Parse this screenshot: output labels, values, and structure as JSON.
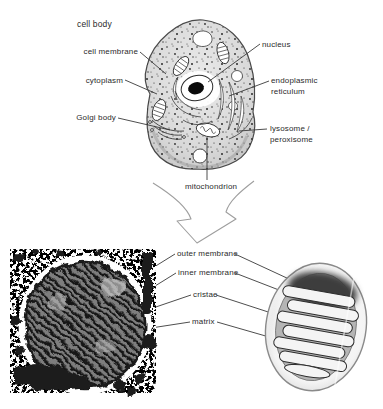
{
  "top_diagram": {
    "title": "cell body",
    "labels": {
      "cell_membrane": "cell membrane",
      "cytoplasm": "cytoplasm",
      "golgi_body": "Golgi body",
      "nucleus": "nucleus",
      "endoplasmic_reticulum_line1": "endoplasmic",
      "endoplasmic_reticulum_line2": "reticulum",
      "lysosome_line1": "lysosome /",
      "lysosome_line2": "peroxisome",
      "mitochondrion": "mitochondrion"
    }
  },
  "bottom_diagram": {
    "labels": {
      "outer_membrane": "outer membrane",
      "inner_membrane": "inner membrane",
      "cristae": "cristae",
      "matrix": "matrix"
    }
  },
  "colors": {
    "ink": "#2b2b2b",
    "leader_line": "#3a3a3a",
    "arrow_outline": "#9e9e9e",
    "cell_fill": "#d9d9d9",
    "micrograph_dark": "#1a1a1a"
  }
}
